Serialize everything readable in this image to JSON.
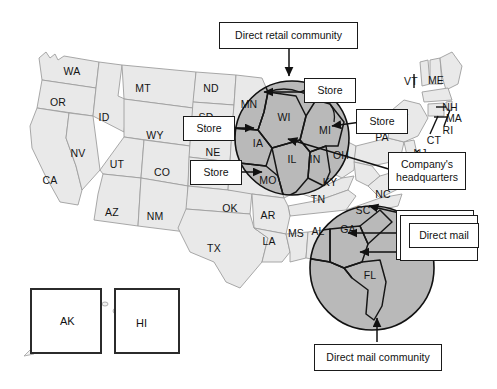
{
  "figure": {
    "type": "annotated-map",
    "region": "United States",
    "background_color": "#ffffff",
    "base_state_fill": "#e9e9e9",
    "highlight_fill": "#b9b9b9",
    "outline_color": "#9a9a9a",
    "highlight_outline_color": "#1a1a1a"
  },
  "callouts": [
    {
      "id": "direct-retail-community",
      "label": "Direct retail community"
    },
    {
      "id": "store-upper",
      "label": "Store"
    },
    {
      "id": "store-left",
      "label": "Store"
    },
    {
      "id": "store-lower",
      "label": "Store"
    },
    {
      "id": "store-right",
      "label": "Store"
    },
    {
      "id": "company-headquarters",
      "label": "Company's headquarters"
    },
    {
      "id": "direct-mail",
      "label": "Direct mail"
    },
    {
      "id": "direct-mail-community",
      "label": "Direct mail community"
    }
  ],
  "communities": [
    {
      "id": "direct-retail",
      "caption": "Direct retail community",
      "states": [
        "MN",
        "WI",
        "IA",
        "IL",
        "IN",
        "MI",
        "MO"
      ]
    },
    {
      "id": "direct-mail",
      "caption": "Direct mail community",
      "states": [
        "AL",
        "GA",
        "SC",
        "FL"
      ]
    }
  ],
  "state_labels": [
    {
      "code": "WA",
      "x": 72,
      "y": 71
    },
    {
      "code": "OR",
      "x": 58,
      "y": 102
    },
    {
      "code": "ID",
      "x": 104,
      "y": 117
    },
    {
      "code": "MT",
      "x": 143,
      "y": 88
    },
    {
      "code": "ND",
      "x": 211,
      "y": 88
    },
    {
      "code": "SD",
      "x": 206,
      "y": 117
    },
    {
      "code": "WY",
      "x": 155,
      "y": 135
    },
    {
      "code": "NV",
      "x": 78,
      "y": 153
    },
    {
      "code": "UT",
      "x": 117,
      "y": 164
    },
    {
      "code": "CO",
      "x": 162,
      "y": 172
    },
    {
      "code": "CA",
      "x": 50,
      "y": 180
    },
    {
      "code": "NE",
      "x": 213,
      "y": 152
    },
    {
      "code": "AZ",
      "x": 112,
      "y": 212
    },
    {
      "code": "NM",
      "x": 155,
      "y": 216
    },
    {
      "code": "TX",
      "x": 214,
      "y": 248
    },
    {
      "code": "OK",
      "x": 230,
      "y": 208
    },
    {
      "code": "AR",
      "x": 268,
      "y": 215
    },
    {
      "code": "LA",
      "x": 269,
      "y": 241
    },
    {
      "code": "MS",
      "x": 296,
      "y": 233
    },
    {
      "code": "MN",
      "x": 249,
      "y": 104
    },
    {
      "code": "WI",
      "x": 284,
      "y": 117
    },
    {
      "code": "IA",
      "x": 258,
      "y": 143
    },
    {
      "code": "IL",
      "x": 292,
      "y": 159
    },
    {
      "code": "IN",
      "x": 315,
      "y": 159
    },
    {
      "code": "MI",
      "x": 325,
      "y": 130
    },
    {
      "code": "MO",
      "x": 268,
      "y": 180
    },
    {
      "code": "OH",
      "x": 341,
      "y": 155
    },
    {
      "code": "KY",
      "x": 330,
      "y": 182
    },
    {
      "code": "TN",
      "x": 318,
      "y": 199
    },
    {
      "code": "AL",
      "x": 318,
      "y": 231
    },
    {
      "code": "GA",
      "x": 348,
      "y": 229
    },
    {
      "code": "SC",
      "x": 363,
      "y": 210
    },
    {
      "code": "NC",
      "x": 383,
      "y": 194
    },
    {
      "code": "FL",
      "x": 370,
      "y": 275
    },
    {
      "code": "PA",
      "x": 382,
      "y": 137
    },
    {
      "code": "NY",
      "x": 401,
      "y": 118
    },
    {
      "code": "VT",
      "x": 411,
      "y": 81
    },
    {
      "code": "ME",
      "x": 436,
      "y": 80
    },
    {
      "code": "NH",
      "x": 450,
      "y": 107
    },
    {
      "code": "MA",
      "x": 454,
      "y": 118
    },
    {
      "code": "RI",
      "x": 448,
      "y": 130
    },
    {
      "code": "CT",
      "x": 434,
      "y": 140
    },
    {
      "code": "NJ",
      "x": 420,
      "y": 153
    }
  ],
  "insets": [
    {
      "id": "alaska",
      "label": "AK"
    },
    {
      "id": "hawaii",
      "label": "HI"
    }
  ]
}
